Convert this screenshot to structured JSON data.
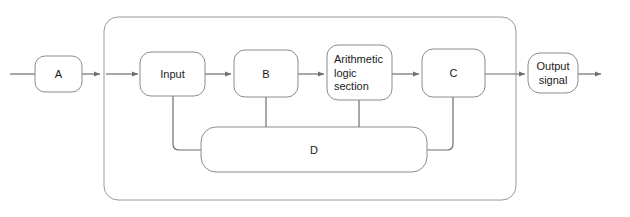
{
  "diagram": {
    "type": "block-diagram",
    "canvas": {
      "width": 630,
      "height": 217,
      "background": "#ffffff"
    },
    "colors": {
      "node_stroke": "#8c8c8c",
      "container_stroke": "#9a9a9a",
      "connector_stroke": "#6e6e6e",
      "node_fill": "#ffffff",
      "text": "#1a1a1a"
    },
    "container": {
      "label": "",
      "x": 104,
      "y": 17,
      "width": 412,
      "height": 183,
      "radius": 14
    },
    "nodes": [
      {
        "id": "a",
        "label": "A",
        "x": 35,
        "y": 56,
        "width": 47,
        "height": 36,
        "radius": 10,
        "align": "center",
        "lines": [
          "A"
        ]
      },
      {
        "id": "input",
        "label": "Input",
        "x": 140,
        "y": 52,
        "width": 65,
        "height": 44,
        "radius": 11,
        "align": "center",
        "lines": [
          "Input"
        ]
      },
      {
        "id": "b",
        "label": "B",
        "x": 234,
        "y": 50,
        "width": 64,
        "height": 47,
        "radius": 11,
        "align": "center",
        "lines": [
          "B"
        ]
      },
      {
        "id": "als",
        "label": "Arithmetic logic section",
        "x": 327,
        "y": 45,
        "width": 65,
        "height": 55,
        "radius": 11,
        "align": "left",
        "lines": [
          "Arithmetic",
          "logic",
          "section"
        ]
      },
      {
        "id": "c",
        "label": "C",
        "x": 422,
        "y": 49,
        "width": 63,
        "height": 48,
        "radius": 11,
        "align": "center",
        "lines": [
          "C"
        ]
      },
      {
        "id": "output",
        "label": "Output signal",
        "x": 528,
        "y": 53,
        "width": 50,
        "height": 40,
        "radius": 12,
        "align": "center",
        "lines": [
          "Output",
          "signal"
        ]
      },
      {
        "id": "d",
        "label": "D",
        "x": 201,
        "y": 127,
        "width": 226,
        "height": 45,
        "radius": 15,
        "align": "center",
        "lines": [
          "D"
        ]
      }
    ],
    "connectors": [
      {
        "id": "source-to-a",
        "from": "source",
        "to": "a",
        "arrow": false,
        "path": "M 10 74 L 35 74"
      },
      {
        "id": "a-to-boundary",
        "from": "a",
        "to": "container",
        "arrow": true,
        "path": "M 82 74 L 100 74"
      },
      {
        "id": "boundary-to-input",
        "from": "container",
        "to": "input",
        "arrow": true,
        "path": "M 106 74 L 138 74"
      },
      {
        "id": "input-to-b",
        "from": "input",
        "to": "b",
        "arrow": true,
        "path": "M 205 74 L 231 74"
      },
      {
        "id": "b-to-als",
        "from": "b",
        "to": "als",
        "arrow": true,
        "path": "M 298 74 L 324 74"
      },
      {
        "id": "als-to-c",
        "from": "als",
        "to": "c",
        "arrow": true,
        "path": "M 392 74 L 419 74"
      },
      {
        "id": "c-to-output",
        "from": "c",
        "to": "output",
        "arrow": true,
        "path": "M 485 74 L 525 74"
      },
      {
        "id": "output-to-sink",
        "from": "output",
        "to": "sink",
        "arrow": true,
        "path": "M 578 74 L 601 74"
      },
      {
        "id": "input-to-d",
        "from": "input",
        "to": "d",
        "arrow": false,
        "path": "M 173 96 L 173 144 Q 173 150 179 150 L 201 150"
      },
      {
        "id": "b-to-d",
        "from": "b",
        "to": "d",
        "arrow": false,
        "path": "M 266 97 L 266 127"
      },
      {
        "id": "als-to-d",
        "from": "als",
        "to": "d",
        "arrow": false,
        "path": "M 359 100 L 359 127"
      },
      {
        "id": "c-to-d",
        "from": "c",
        "to": "d",
        "arrow": false,
        "path": "M 453 97 L 453 144 Q 453 150 447 150 L 427 150"
      }
    ],
    "flow_sequence": [
      "A",
      "Input",
      "B",
      "Arithmetic logic section",
      "C",
      "Output signal"
    ],
    "feedback_bus": "D"
  }
}
